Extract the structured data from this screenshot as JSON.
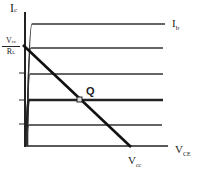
{
  "diagram": {
    "y_axis_label": "I",
    "y_axis_sub": "c",
    "x_axis_label": "V",
    "x_axis_sub": "CE",
    "curve_family_label": "I",
    "curve_family_sub": "b",
    "intercept_y_numerator": "V",
    "intercept_y_numerator_sub": "cc",
    "intercept_y_denominator": "R",
    "intercept_y_denominator_sub": "L",
    "intercept_x": "V",
    "intercept_x_sub": "cc",
    "q_point_label": "Q",
    "colors": {
      "line": "#222222",
      "curve": "#333333",
      "background": "#ffffff"
    }
  }
}
